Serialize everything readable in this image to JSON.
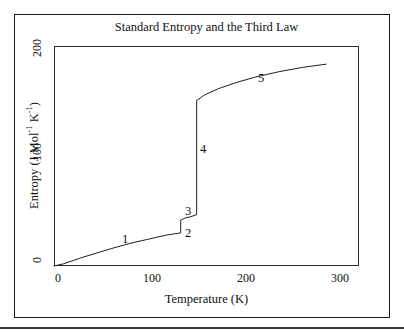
{
  "figure": {
    "title": "Standard Entropy and the Third Law",
    "border_color": "#1a1a1a",
    "curve_color": "#1f1f1f",
    "background": "#ffffff"
  },
  "chart_data": {
    "type": "line",
    "title": "Standard Entropy and the Third Law",
    "xlabel": "Temperature (K)",
    "ylabel": "Entropy (J Mol⁻¹ K⁻¹)",
    "xlim": [
      0,
      325
    ],
    "ylim": [
      0,
      206
    ],
    "xticks": [
      0,
      100,
      200,
      300
    ],
    "xticklabels": [
      "0",
      "100",
      "200",
      "300"
    ],
    "yticks": [
      0,
      100,
      200
    ],
    "yticklabels": [
      "0",
      "100",
      "200"
    ],
    "grid": false,
    "legend": null,
    "series": [
      {
        "name": "Standard entropy vs temperature",
        "description": "Entropy of a substance rising from zero at 0 K through solid heating, fusion, liquid heating, vaporization and gas heating",
        "x": [
          0,
          10,
          20,
          30,
          45,
          60,
          80,
          100,
          120,
          135,
          135,
          140,
          145,
          152,
          152,
          160,
          175,
          195,
          215,
          240,
          265,
          290
        ],
        "y": [
          0,
          2,
          5,
          8,
          12,
          16,
          21,
          25,
          29,
          31,
          43,
          45,
          46,
          48,
          155,
          160,
          166,
          172,
          177,
          182,
          186,
          189
        ]
      }
    ],
    "annotations": [
      {
        "label": "1",
        "x": 75,
        "y": 30,
        "meaning": "heating of solid"
      },
      {
        "label": "2",
        "x": 140,
        "y": 36,
        "meaning": "entropy of fusion (melting)"
      },
      {
        "label": "3",
        "x": 140,
        "y": 54,
        "meaning": "heating of liquid"
      },
      {
        "label": "4",
        "x": 158,
        "y": 102,
        "meaning": "entropy of vaporization (boiling)"
      },
      {
        "label": "5",
        "x": 205,
        "y": 188,
        "meaning": "heating of gas"
      }
    ]
  }
}
